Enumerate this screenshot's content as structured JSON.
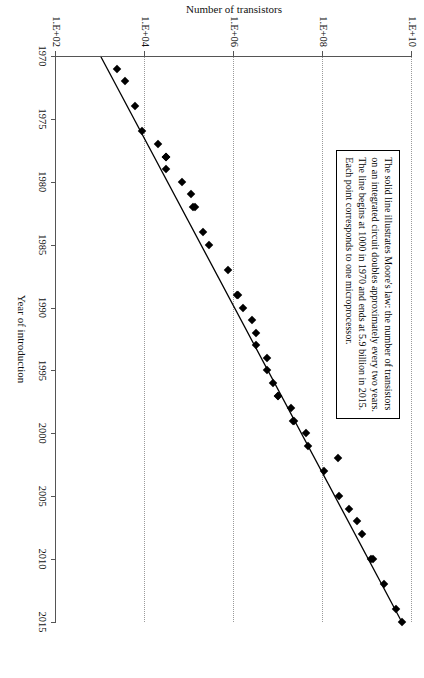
{
  "chart_data": {
    "type": "scatter",
    "title": "",
    "xlabel": "Year of introduction",
    "ylabel": "Number of transistors",
    "xlim": [
      1970,
      2015
    ],
    "ylim_log": [
      100,
      10000000000
    ],
    "xticks": [
      "1970",
      "1975",
      "1980",
      "1985",
      "1990",
      "1995",
      "2000",
      "2005",
      "2010",
      "2015"
    ],
    "xtick_values": [
      1970,
      1975,
      1980,
      1985,
      1990,
      1995,
      2000,
      2005,
      2010,
      2015
    ],
    "yticks": [
      "1.E+02",
      "1.E+04",
      "1.E+06",
      "1.E+08",
      "1.E+10"
    ],
    "ytick_values": [
      100,
      10000,
      1000000,
      100000000,
      10000000000
    ],
    "grid": "horizontal-dotted",
    "legend": "none",
    "marker": "filled-diamond",
    "marker_color": "#000000",
    "line_color": "#000000",
    "series": [
      {
        "name": "Microprocessors",
        "points": [
          {
            "x": 1971,
            "y": 2300
          },
          {
            "x": 1972,
            "y": 3500
          },
          {
            "x": 1974,
            "y": 6000
          },
          {
            "x": 1976,
            "y": 8500
          },
          {
            "x": 1977,
            "y": 20000
          },
          {
            "x": 1978,
            "y": 29000
          },
          {
            "x": 1978,
            "y": 29000
          },
          {
            "x": 1978,
            "y": 30000
          },
          {
            "x": 1979,
            "y": 29000
          },
          {
            "x": 1980,
            "y": 68000
          },
          {
            "x": 1981,
            "y": 110000
          },
          {
            "x": 1982,
            "y": 120000
          },
          {
            "x": 1982,
            "y": 134000
          },
          {
            "x": 1984,
            "y": 200000
          },
          {
            "x": 1985,
            "y": 275000
          },
          {
            "x": 1987,
            "y": 730000
          },
          {
            "x": 1989,
            "y": 1180000
          },
          {
            "x": 1989,
            "y": 1200000
          },
          {
            "x": 1990,
            "y": 1600000
          },
          {
            "x": 1991,
            "y": 2500000
          },
          {
            "x": 1992,
            "y": 3100000
          },
          {
            "x": 1993,
            "y": 3100000
          },
          {
            "x": 1994,
            "y": 5500000
          },
          {
            "x": 1995,
            "y": 5500000
          },
          {
            "x": 1996,
            "y": 7500000
          },
          {
            "x": 1997,
            "y": 9500000
          },
          {
            "x": 1997,
            "y": 10000000
          },
          {
            "x": 1998,
            "y": 19000000
          },
          {
            "x": 1999,
            "y": 21000000
          },
          {
            "x": 1999,
            "y": 22000000
          },
          {
            "x": 2000,
            "y": 42000000
          },
          {
            "x": 2001,
            "y": 45000000
          },
          {
            "x": 2002,
            "y": 220000000
          },
          {
            "x": 2003,
            "y": 105000000
          },
          {
            "x": 2005,
            "y": 230000000
          },
          {
            "x": 2006,
            "y": 380000000
          },
          {
            "x": 2007,
            "y": 580000000
          },
          {
            "x": 2008,
            "y": 760000000
          },
          {
            "x": 2010,
            "y": 1170000000
          },
          {
            "x": 2010,
            "y": 1300000000
          },
          {
            "x": 2012,
            "y": 2400000000
          },
          {
            "x": 2014,
            "y": 4300000000
          },
          {
            "x": 2015,
            "y": 5900000000
          }
        ]
      }
    ],
    "trendline": {
      "name": "Moore's law",
      "start": {
        "x": 1970,
        "y": 1000
      },
      "end": {
        "x": 2015,
        "y": 5900000000
      },
      "style": "solid"
    },
    "annotation": {
      "lines": [
        "The solid line illustrates Moore's law: the number of transistors",
        "on an integrated circuit doubles approximately every two years.",
        "The line begins at 1000 in 1970 and ends at 5.9 billion in 2015.",
        "Each point corresponds to one microprocessor."
      ]
    }
  }
}
